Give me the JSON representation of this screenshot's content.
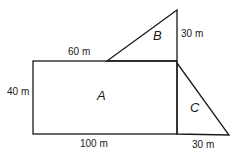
{
  "diagram": {
    "regions": {
      "A": {
        "label": "A",
        "shape": "rectangle"
      },
      "B": {
        "label": "B",
        "shape": "right-triangle"
      },
      "C": {
        "label": "C",
        "shape": "right-triangle"
      }
    },
    "dimensions": {
      "rect_top_segment": "60 m",
      "rect_height": "40 m",
      "rect_width": "100 m",
      "triangle_b_height": "30 m",
      "triangle_c_base": "30 m"
    },
    "colors": {
      "stroke": "#1a1a1a",
      "background": "#ffffff"
    }
  }
}
